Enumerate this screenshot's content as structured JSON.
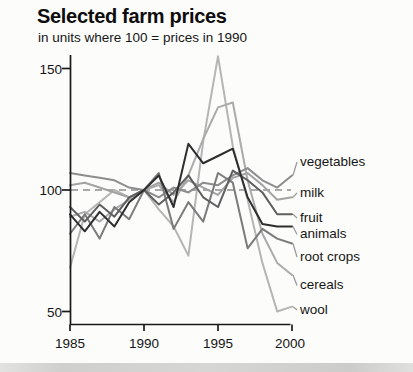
{
  "header": {
    "title": "Selected farm prices",
    "subtitle": "in units where 100 = prices in 1990"
  },
  "chart_data": {
    "type": "line",
    "title": "Selected farm prices",
    "subtitle": "in units where 100 = prices in 1990",
    "x": [
      1985,
      1986,
      1987,
      1988,
      1989,
      1990,
      1991,
      1992,
      1993,
      1994,
      1995,
      1996,
      1997,
      1998,
      1999,
      2000
    ],
    "x_ticks": [
      "1985",
      "1990",
      "1995",
      "2000"
    ],
    "y_ticks": [
      "150",
      "100",
      "50"
    ],
    "xlim": [
      1985,
      2000
    ],
    "ylim": [
      45,
      157
    ],
    "grid": "off",
    "reference_line": {
      "value": 100,
      "style": "dashed"
    },
    "legend_position": "right-annotations",
    "series": [
      {
        "name": "vegetables",
        "color": "#8d8d8d",
        "label_value": 111.5,
        "values": [
          107,
          106,
          105,
          104,
          101,
          100,
          97,
          101,
          99,
          103,
          102,
          106,
          109,
          104,
          101,
          106
        ]
      },
      {
        "name": "milk",
        "color": "#a3a3a3",
        "label_value": 98.8,
        "values": [
          102,
          103,
          101,
          99,
          97,
          100,
          103,
          98,
          104,
          101,
          98,
          105,
          107,
          102,
          96,
          97
        ]
      },
      {
        "name": "fruit",
        "color": "#5f5f5f",
        "label_value": 88.5,
        "values": [
          93,
          87,
          94,
          89,
          97,
          100,
          94,
          99,
          106,
          97,
          93,
          108,
          104,
          99,
          90,
          90
        ]
      },
      {
        "name": "animals",
        "color": "#2e2e2e",
        "label_value": 81.7,
        "values": [
          90,
          83,
          91,
          85,
          95,
          100,
          106,
          93,
          119,
          111,
          114,
          117,
          97,
          86,
          85,
          85
        ]
      },
      {
        "name": "root crops",
        "color": "#7b7b7b",
        "label_value": 72.4,
        "values": [
          82,
          90,
          80,
          93,
          88,
          100,
          107,
          84,
          95,
          87,
          107,
          103,
          76,
          84,
          80,
          78
        ]
      },
      {
        "name": "cereals",
        "color": "#ababab",
        "label_value": 60.7,
        "values": [
          89,
          91,
          87,
          92,
          96,
          100,
          102,
          95,
          106,
          121,
          134,
          136,
          104,
          82,
          70,
          65
        ]
      },
      {
        "name": "wool",
        "color": "#b5b5b5",
        "label_value": 50.6,
        "values": [
          68,
          90,
          95,
          100,
          97,
          100,
          92,
          85,
          73,
          120,
          155,
          118,
          96,
          70,
          50,
          52
        ]
      }
    ]
  }
}
